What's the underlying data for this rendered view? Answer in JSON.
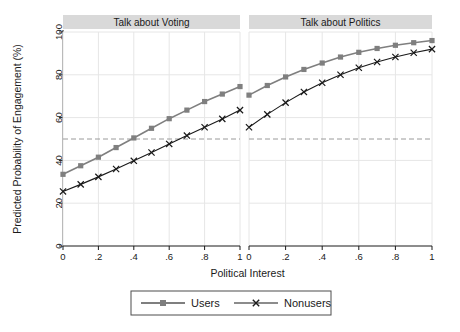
{
  "figure": {
    "background": "#ffffff",
    "xlabel": "Political Interest",
    "ylabel": "Predicted Probability of Engagement (%)",
    "panel_title_bg": "#d9d9d9",
    "reference_line_value": 50,
    "reference_line_color": "#9a9a9a"
  },
  "legend": {
    "items": [
      {
        "label": "Users",
        "marker": "square",
        "color": "#7f7f7f"
      },
      {
        "label": "Nonusers",
        "marker": "cross",
        "color": "#1a1a1a"
      }
    ],
    "border_color": "#4d4d4d"
  },
  "axes": {
    "y_ticks": [
      "0",
      "20",
      "40",
      "60",
      "80",
      "100"
    ],
    "x_ticks": [
      "0",
      ".2",
      ".4",
      ".6",
      ".8",
      "1"
    ]
  },
  "chart_data": {
    "type": "line",
    "title": "",
    "xlabel": "Political Interest",
    "ylabel": "Predicted Probability of Engagement (%)",
    "xlim": [
      0,
      1
    ],
    "ylim": [
      0,
      100
    ],
    "grid": true,
    "legend_position": "bottom",
    "reference_lines": [
      {
        "axis": "y",
        "value": 50,
        "style": "dashed"
      }
    ],
    "panels": [
      {
        "title": "Talk about Voting",
        "x": [
          0,
          0.1,
          0.2,
          0.3,
          0.4,
          0.5,
          0.6,
          0.7,
          0.8,
          0.9,
          1.0
        ],
        "series": [
          {
            "name": "Users",
            "marker": "square",
            "color": "#7f7f7f",
            "values": [
              33.5,
              37.5,
              41.5,
              46.0,
              50.5,
              55.0,
              59.5,
              63.5,
              67.5,
              71.0,
              74.5
            ]
          },
          {
            "name": "Nonusers",
            "marker": "cross",
            "color": "#1a1a1a",
            "values": [
              25.5,
              28.8,
              32.3,
              36.0,
              39.8,
              43.7,
              47.7,
              51.6,
              55.5,
              59.4,
              63.5
            ]
          }
        ]
      },
      {
        "title": "Talk about Politics",
        "x": [
          0,
          0.1,
          0.2,
          0.3,
          0.4,
          0.5,
          0.6,
          0.7,
          0.8,
          0.9,
          1.0
        ],
        "series": [
          {
            "name": "Users",
            "marker": "square",
            "color": "#7f7f7f",
            "values": [
              70.5,
              75.0,
              79.0,
              82.5,
              85.5,
              88.3,
              90.5,
              92.3,
              93.8,
              95.0,
              96.0
            ]
          },
          {
            "name": "Nonusers",
            "marker": "cross",
            "color": "#1a1a1a",
            "values": [
              55.5,
              61.5,
              67.0,
              72.0,
              76.3,
              80.0,
              83.3,
              86.0,
              88.3,
              90.3,
              92.0
            ]
          }
        ]
      }
    ]
  }
}
